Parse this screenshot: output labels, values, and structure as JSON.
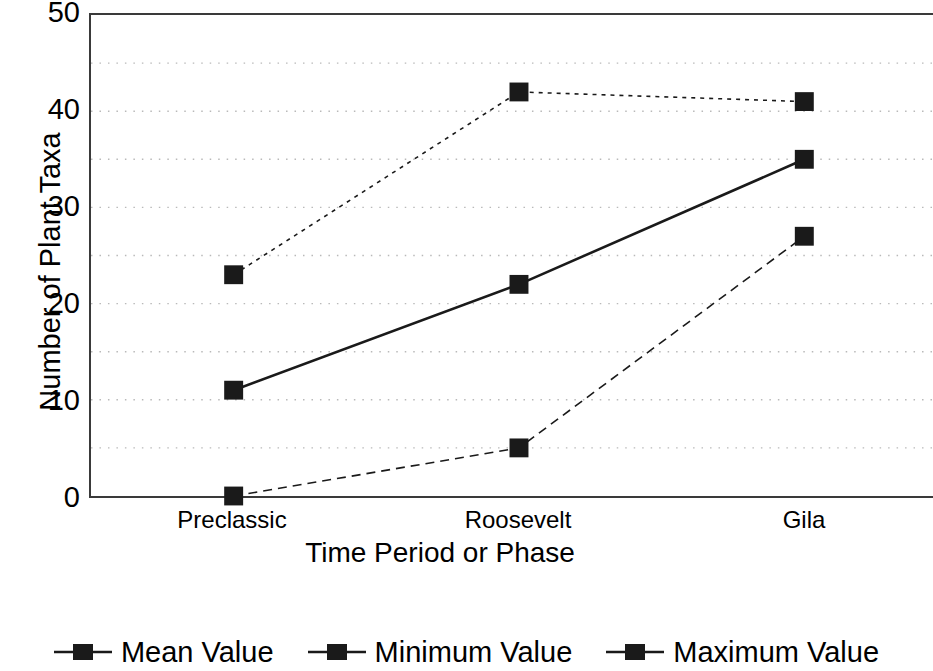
{
  "chart_data": {
    "type": "line",
    "title": "",
    "xlabel": "Time Period or Phase",
    "ylabel": "Number of Plant Taxa",
    "categories": [
      "Preclassic",
      "Roosevelt",
      "Gila"
    ],
    "series": [
      {
        "name": "Mean Value",
        "values": [
          11,
          22,
          35
        ],
        "line_style": "solid",
        "marker": "filled-square"
      },
      {
        "name": "Minimum Value",
        "values": [
          0,
          5,
          27
        ],
        "line_style": "dashed",
        "marker": "filled-square"
      },
      {
        "name": "Maximum Value",
        "values": [
          23,
          42,
          41
        ],
        "line_style": "dotted",
        "marker": "filled-square"
      }
    ],
    "ylim": [
      0,
      50
    ],
    "ytick_labels": [
      "0",
      "10",
      "20",
      "30",
      "40",
      "50"
    ],
    "ytick_values": [
      0,
      10,
      20,
      30,
      40,
      50
    ],
    "gridline_values": [
      5,
      10,
      15,
      20,
      25,
      30,
      35,
      40,
      45
    ],
    "grid": "horizontal-dotted",
    "legend_position": "bottom",
    "series_color": "#1a1a1a",
    "grid_color": "#b9b9b9",
    "axis_color": "#3a3a3a"
  },
  "axes": {
    "y_title": "Number of Plant Taxa",
    "x_title": "Time Period or Phase",
    "y_ticks": [
      {
        "label": "50",
        "value": 50
      },
      {
        "label": "40",
        "value": 40
      },
      {
        "label": "30",
        "value": 30
      },
      {
        "label": "20",
        "value": 20
      },
      {
        "label": "10",
        "value": 10
      },
      {
        "label": "0",
        "value": 0
      }
    ],
    "x_ticks": [
      {
        "label": "Preclassic"
      },
      {
        "label": "Roosevelt"
      },
      {
        "label": "Gila"
      }
    ]
  },
  "legend": {
    "items": [
      {
        "label": "Mean Value"
      },
      {
        "label": "Minimum Value"
      },
      {
        "label": "Maximum Value"
      }
    ]
  }
}
